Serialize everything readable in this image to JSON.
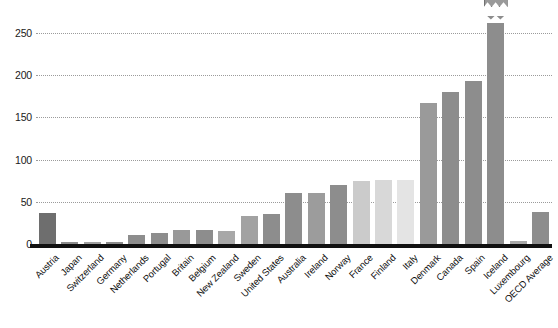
{
  "chart_data": {
    "type": "bar",
    "title": "",
    "subtitle": "",
    "xlabel": "",
    "ylabel": "",
    "ylim": [
      0,
      280
    ],
    "yticks": [
      0,
      50,
      100,
      150,
      200,
      250
    ],
    "grid": true,
    "legend": null,
    "broken_axis": true,
    "annotations": [
      {
        "category": "Iceland",
        "label": "581",
        "note": "bar is truncated; true value shown in callout box"
      }
    ],
    "categories": [
      "Austria",
      "Japan",
      "Switzerland",
      "Germany",
      "Netherlands",
      "Portugal",
      "Britain",
      "Belgium",
      "New Zealand",
      "Sweden",
      "United States",
      "Australia",
      "Ireland",
      "Norway",
      "France",
      "Finland",
      "Italy",
      "Denmark",
      "Canada",
      "Spain",
      "Iceland",
      "Luxembourg",
      "OECD Average"
    ],
    "values": [
      37,
      2,
      2,
      2,
      11,
      13,
      17,
      17,
      15,
      33,
      35,
      60,
      60,
      70,
      75,
      76,
      76,
      167,
      180,
      193,
      581,
      3,
      38
    ],
    "bar_colors": [
      "#6e6e6e",
      "#8d8d8d",
      "#a0a0a0",
      "#8d8d8d",
      "#8d8d8d",
      "#8d8d8d",
      "#999999",
      "#8d8d8d",
      "#a8a8a8",
      "#a2a2a2",
      "#8d8d8d",
      "#8d8d8d",
      "#9c9c9c",
      "#8d8d8d",
      "#cbcbcb",
      "#d8d8d8",
      "#e4e4e4",
      "#9a9a9a",
      "#8d8d8d",
      "#8d8d8d",
      "#8d8d8d",
      "#a8a8a8",
      "#8d8d8d"
    ],
    "display_max": 270,
    "axis_color": "#111111",
    "grid_color": "#8a8a8a"
  }
}
